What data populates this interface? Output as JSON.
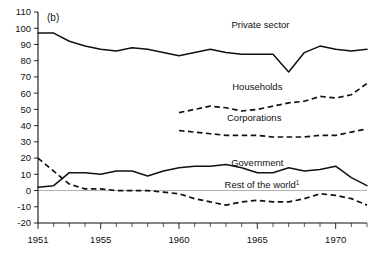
{
  "chart_data": {
    "type": "line",
    "title": "",
    "panel_label": "(b)",
    "xlabel": "",
    "ylabel": "",
    "xlim": [
      1951,
      1972
    ],
    "ylim": [
      -20,
      110
    ],
    "yticks": [
      110,
      100,
      90,
      80,
      70,
      60,
      50,
      40,
      30,
      20,
      10,
      0,
      -10,
      -20
    ],
    "ytick_labels": [
      "110",
      "100",
      "90",
      "80",
      "70",
      "60",
      "50",
      "40",
      "30",
      "20",
      "10",
      "0",
      "-10",
      "-20"
    ],
    "xticks": [
      1951,
      1955,
      1960,
      1965,
      1970
    ],
    "xtick_labels": [
      "1951",
      "1955",
      "1960",
      "1965",
      "1970"
    ],
    "x_minor_tick_interval": 1,
    "grid": false,
    "legend_position": "inline-labels",
    "zero_line": true,
    "series": [
      {
        "name": "Private sector",
        "style": "solid",
        "label": "Private sector",
        "label_x": 1965.2,
        "label_y": 100.0,
        "x": [
          1951,
          1952,
          1953,
          1954,
          1955,
          1956,
          1957,
          1958,
          1959,
          1960,
          1961,
          1962,
          1963,
          1964,
          1965,
          1966,
          1967,
          1968,
          1969,
          1970,
          1971,
          1972
        ],
        "values": [
          97,
          97,
          92,
          89,
          87,
          86,
          88,
          87,
          85,
          83,
          85,
          87,
          85,
          84,
          84,
          84,
          73,
          85,
          89,
          87,
          86,
          87
        ]
      },
      {
        "name": "Households",
        "style": "dashed",
        "label": "Households",
        "label_x": 1965.0,
        "label_y": 62.0,
        "x": [
          1960,
          1961,
          1962,
          1963,
          1964,
          1965,
          1966,
          1967,
          1968,
          1969,
          1970,
          1971,
          1972
        ],
        "values": [
          48,
          50,
          52,
          51,
          49,
          50,
          52,
          54,
          55,
          58,
          57,
          59,
          66
        ]
      },
      {
        "name": "Corporations",
        "style": "dashed",
        "label": "Corporations",
        "label_x": 1964.8,
        "label_y": 43.0,
        "x": [
          1960,
          1961,
          1962,
          1963,
          1964,
          1965,
          1966,
          1967,
          1968,
          1969,
          1970,
          1971,
          1972
        ],
        "values": [
          37,
          36,
          35,
          34,
          34,
          34,
          33,
          33,
          33,
          34,
          34,
          36,
          38
        ]
      },
      {
        "name": "Government",
        "style": "solid",
        "label": "Government",
        "label_x": 1965.0,
        "label_y": 15.0,
        "x": [
          1951,
          1952,
          1953,
          1954,
          1955,
          1956,
          1957,
          1958,
          1959,
          1960,
          1961,
          1962,
          1963,
          1964,
          1965,
          1966,
          1967,
          1968,
          1969,
          1970,
          1971,
          1972
        ],
        "values": [
          2,
          3,
          11,
          11,
          10,
          12,
          12,
          9,
          12,
          14,
          15,
          15,
          16,
          14,
          11,
          11,
          14,
          12,
          13,
          15,
          8,
          3
        ]
      },
      {
        "name": "Rest of the world",
        "style": "dashed",
        "label": "Rest of the world",
        "label_superscript": "1",
        "label_x": 1965.3,
        "label_y": 1.5,
        "x": [
          1951,
          1952,
          1953,
          1954,
          1955,
          1956,
          1957,
          1958,
          1959,
          1960,
          1961,
          1962,
          1963,
          1964,
          1965,
          1966,
          1967,
          1968,
          1969,
          1970,
          1971,
          1972
        ],
        "values": [
          20,
          12,
          4,
          1,
          1,
          0,
          0,
          0,
          -1,
          -2,
          -5,
          -7,
          -9,
          -7,
          -6,
          -7,
          -7,
          -5,
          -2,
          -3,
          -5,
          -9
        ]
      }
    ]
  }
}
